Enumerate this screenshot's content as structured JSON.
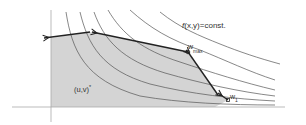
{
  "diagram": {
    "type": "optimization-feasible-region",
    "labels": {
      "level_curve": "f(x,y)=const.",
      "level_curve_f": "f",
      "level_curve_args": "(x,y)",
      "level_curve_rest": "=const.",
      "region": "(u,v)*",
      "region_main": "(u,v)",
      "region_sup": "*",
      "w_max_base": "w",
      "w_max_sub": "max",
      "w_1_base": "w",
      "w_1_sub": "1"
    },
    "colors": {
      "background": "#ffffff",
      "region_fill": "#d4d4d4",
      "boundary": "#222222",
      "level_curves": "#555555",
      "axes": "#aaaaaa",
      "text": "#333333"
    },
    "axes": {
      "vertical": {
        "x": 51,
        "y1": 10,
        "y2": 122
      },
      "horizontal": {
        "y": 107,
        "x1": 12,
        "x2": 285
      }
    },
    "region_polygon": [
      [
        51,
        38
      ],
      [
        90,
        32
      ],
      [
        188,
        52
      ],
      [
        218,
        95
      ],
      [
        228,
        100
      ],
      [
        215,
        107
      ],
      [
        51,
        107
      ]
    ],
    "boundary_path": [
      [
        228,
        100
      ],
      [
        218,
        95
      ],
      [
        188,
        52
      ],
      [
        90,
        32
      ],
      [
        44,
        38
      ]
    ],
    "points": {
      "w_max": [
        188,
        52
      ],
      "w_1": [
        228,
        100
      ]
    }
  }
}
